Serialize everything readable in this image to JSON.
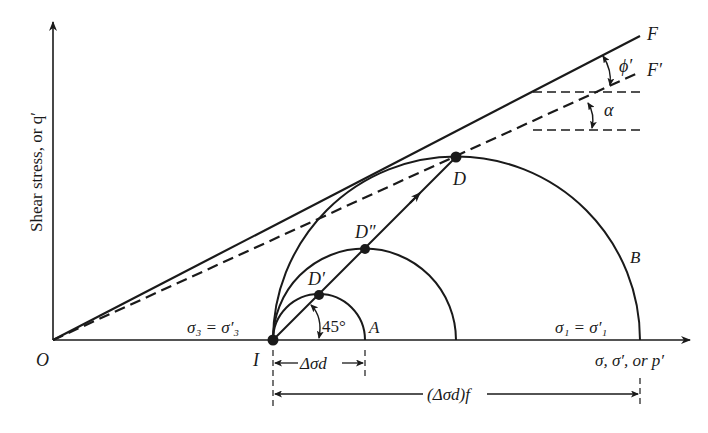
{
  "diagram": {
    "y_axis_label": "Shear stress, or q′",
    "x_axis_label": "σ, σ′, or p′",
    "origin_label": "O",
    "point_I_label": "I",
    "sigma3_label": "σ₃ = σ′₃",
    "sigma1_label": "σ₁ = σ′₁",
    "circle_A_label": "A",
    "circle_B_label": "B",
    "point_D_label": "D",
    "point_D1_label": "D′",
    "point_D2_label": "D″",
    "angle_45_label": "45°",
    "line_F_label": "F",
    "line_F_prime_label": "F′",
    "phi_label": "ϕ′",
    "alpha_label": "α",
    "delta_sigma_d_label": "Δσd",
    "delta_sigma_d_f_label": "(Δσd)f"
  },
  "colors": {
    "ink": "#1a1a1a",
    "background": "#ffffff"
  }
}
